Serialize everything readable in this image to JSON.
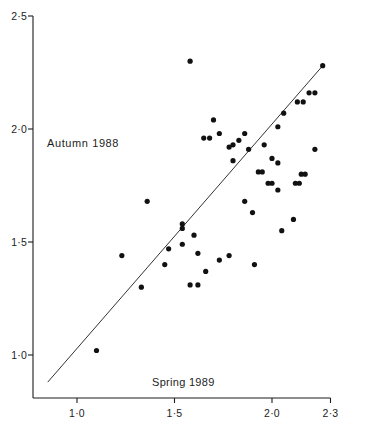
{
  "chart_data": {
    "type": "scatter",
    "title": "",
    "xlabel": "Spring 1989",
    "ylabel": "Autumn 1988",
    "xlim": [
      0.79,
      2.33
    ],
    "ylim": [
      0.8,
      2.55
    ],
    "grid": false,
    "legend": "none",
    "marker_color": "#111111",
    "line_color": "#333333",
    "axis_color": "#1d1d1d",
    "xticks": [
      1.0,
      1.5,
      2.0,
      2.3
    ],
    "xtick_labels": [
      "1·0",
      "1·5",
      "2·0",
      "2·3"
    ],
    "yticks": [
      1.0,
      1.5,
      2.0,
      2.5
    ],
    "ytick_labels": [
      "1·0",
      "1·5",
      "2·0",
      "2·5"
    ],
    "fit_line": {
      "x": [
        0.85,
        2.26
      ],
      "y": [
        0.88,
        2.28
      ]
    },
    "points": [
      {
        "x": 1.1,
        "y": 1.02
      },
      {
        "x": 1.23,
        "y": 1.44
      },
      {
        "x": 1.33,
        "y": 1.3
      },
      {
        "x": 1.36,
        "y": 1.68
      },
      {
        "x": 1.45,
        "y": 1.4
      },
      {
        "x": 1.47,
        "y": 1.47
      },
      {
        "x": 1.54,
        "y": 1.56
      },
      {
        "x": 1.54,
        "y": 1.58
      },
      {
        "x": 1.54,
        "y": 1.49
      },
      {
        "x": 1.58,
        "y": 2.3
      },
      {
        "x": 1.58,
        "y": 1.31
      },
      {
        "x": 1.62,
        "y": 1.31
      },
      {
        "x": 1.6,
        "y": 1.53
      },
      {
        "x": 1.62,
        "y": 1.45
      },
      {
        "x": 1.65,
        "y": 1.96
      },
      {
        "x": 1.68,
        "y": 1.96
      },
      {
        "x": 1.7,
        "y": 2.04
      },
      {
        "x": 1.73,
        "y": 1.98
      },
      {
        "x": 1.78,
        "y": 1.92
      },
      {
        "x": 1.8,
        "y": 1.93
      },
      {
        "x": 1.83,
        "y": 1.95
      },
      {
        "x": 1.8,
        "y": 1.86
      },
      {
        "x": 1.86,
        "y": 1.98
      },
      {
        "x": 1.88,
        "y": 1.91
      },
      {
        "x": 1.86,
        "y": 1.68
      },
      {
        "x": 1.9,
        "y": 1.63
      },
      {
        "x": 1.93,
        "y": 1.81
      },
      {
        "x": 1.95,
        "y": 1.81
      },
      {
        "x": 1.96,
        "y": 1.93
      },
      {
        "x": 1.98,
        "y": 1.76
      },
      {
        "x": 2.0,
        "y": 1.76
      },
      {
        "x": 2.0,
        "y": 1.87
      },
      {
        "x": 2.03,
        "y": 2.01
      },
      {
        "x": 2.03,
        "y": 1.85
      },
      {
        "x": 2.03,
        "y": 1.73
      },
      {
        "x": 2.06,
        "y": 2.07
      },
      {
        "x": 2.05,
        "y": 1.55
      },
      {
        "x": 2.11,
        "y": 1.6
      },
      {
        "x": 2.12,
        "y": 1.76
      },
      {
        "x": 2.14,
        "y": 1.76
      },
      {
        "x": 2.15,
        "y": 1.8
      },
      {
        "x": 2.17,
        "y": 1.8
      },
      {
        "x": 2.13,
        "y": 2.12
      },
      {
        "x": 2.16,
        "y": 2.12
      },
      {
        "x": 2.19,
        "y": 2.16
      },
      {
        "x": 2.22,
        "y": 2.16
      },
      {
        "x": 2.22,
        "y": 1.91
      },
      {
        "x": 2.26,
        "y": 2.28
      },
      {
        "x": 1.91,
        "y": 1.4
      },
      {
        "x": 1.73,
        "y": 1.42
      },
      {
        "x": 1.78,
        "y": 1.44
      },
      {
        "x": 1.66,
        "y": 1.37
      }
    ]
  }
}
